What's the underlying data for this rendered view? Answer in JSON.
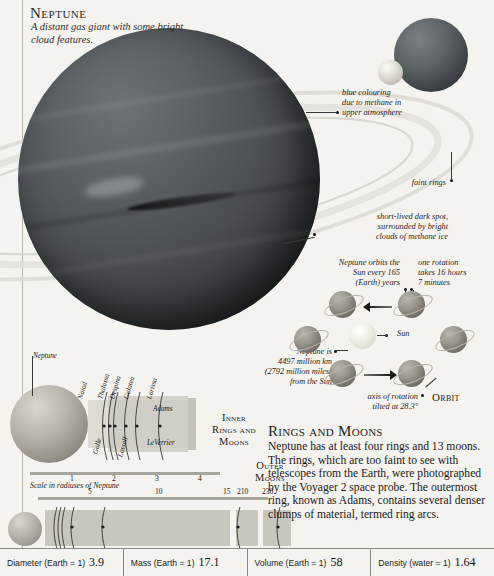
{
  "header": {
    "title": "Neptune",
    "subtitle": "A distant gas giant with some bright cloud features."
  },
  "callouts": {
    "blue_colouring": "blue colouring\ndue to methane in\nupper atmosphere",
    "faint_rings": "faint rings",
    "dark_spot": "short-lived dark spot,\nsurrounded by bright\nclouds of methane ice",
    "orbit_period": "Neptune orbits the\nSun every 165\n(Earth) years",
    "rotation_period": "one rotation\ntakes 16 hours\n7 minutes",
    "distance_from_sun": "Neptune is\n4497 million km\n(2792 million miles)\nfrom the Sun",
    "axis_tilt": "axis of rotation\ntilted at 28.3°",
    "sun_label": "Sun"
  },
  "sections": {
    "orbit_heading": "Orbit",
    "inner_heading": "Inner\nRings and\nMoons",
    "outer_heading": "Outer\nMoons",
    "rings_moons_heading": "Rings and Moons",
    "rings_moons_body": "Neptune has at least four rings and 13 moons. The rings, which are too faint to see with telescopes from the Earth, were photographed by the Voyager 2 space probe. The outermost ring, known as Adams, contains several denser clumps of material, termed ring arcs."
  },
  "inner_diagram": {
    "planet_label": "Neptune",
    "moons": [
      "Naiad",
      "Thalassa",
      "Despina",
      "Galatea",
      "Larissa"
    ],
    "rings": [
      "Galle",
      "Lassell",
      "LeVerrier",
      "Adams"
    ],
    "scale_caption": "Scale in radiuses of Neptune",
    "scale_ticks": [
      "1",
      "2",
      "3",
      "4"
    ]
  },
  "outer_diagram": {
    "scale_ticks": [
      "5",
      "10",
      "15",
      "210",
      "230"
    ],
    "moons": [
      "Neptune",
      "Larissa",
      "Proteus",
      "Triton",
      "Nereid"
    ]
  },
  "data_bar": [
    {
      "label": "Diameter (Earth = 1)",
      "value": "3.9"
    },
    {
      "label": "Mass (Earth = 1)",
      "value": "17.1"
    },
    {
      "label": "Volume (Earth = 1)",
      "value": "58"
    },
    {
      "label": "Density (water = 1)",
      "value": "1.64"
    }
  ],
  "colors": {
    "page_background": "#f5f3ef",
    "rule": "#8d8a84",
    "text": "#1b1b1b",
    "planet_dark": "#33373a",
    "ring_band": "#cfccc4"
  }
}
